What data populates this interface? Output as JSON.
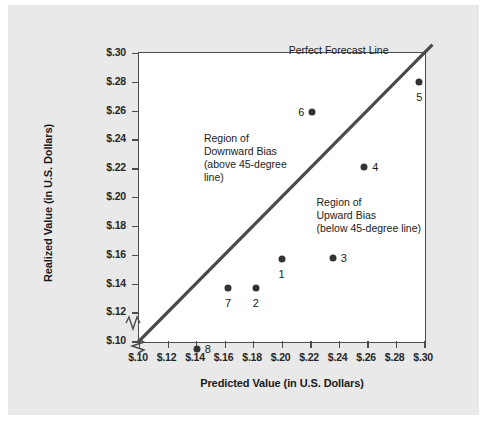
{
  "chart_data": {
    "type": "scatter",
    "title": "",
    "xlabel": "Predicted Value (in U.S. Dollars)",
    "ylabel": "Realized Value (in U.S. Dollars)",
    "xlim": [
      0.1,
      0.3
    ],
    "ylim": [
      0.1,
      0.3
    ],
    "xticks": [
      0.1,
      0.12,
      0.14,
      0.16,
      0.18,
      0.2,
      0.22,
      0.24,
      0.26,
      0.28,
      0.3
    ],
    "yticks": [
      0.1,
      0.12,
      0.14,
      0.16,
      0.18,
      0.2,
      0.22,
      0.24,
      0.26,
      0.28,
      0.3
    ],
    "xticklabels": [
      "$.10",
      "$.12",
      "$.14",
      "$.16",
      "$.18",
      "$.20",
      "$.22",
      "$.24",
      "$.26",
      "$.28",
      "$.30"
    ],
    "yticklabels": [
      "$.10",
      "$.12",
      "$.14",
      "$.16",
      "$.18",
      "$.20",
      "$.22",
      "$.24",
      "$.26",
      "$.28",
      "$.30"
    ],
    "grid": false,
    "axis_break": true,
    "legend": "none",
    "points": [
      {
        "id": "1",
        "x": 0.2,
        "y": 0.157,
        "label_dx": 0,
        "label_dy": 15
      },
      {
        "id": "2",
        "x": 0.182,
        "y": 0.137,
        "label_dx": 0,
        "label_dy": 15
      },
      {
        "id": "3",
        "x": 0.236,
        "y": 0.158,
        "label_dx": 11,
        "label_dy": 0
      },
      {
        "id": "4",
        "x": 0.258,
        "y": 0.221,
        "label_dx": 11,
        "label_dy": 0
      },
      {
        "id": "5",
        "x": 0.2965,
        "y": 0.28,
        "label_dx": 0,
        "label_dy": 15
      },
      {
        "id": "6",
        "x": 0.2215,
        "y": 0.259,
        "label_dx": -11,
        "label_dy": 0
      },
      {
        "id": "7",
        "x": 0.1625,
        "y": 0.137,
        "label_dx": 0,
        "label_dy": 15
      },
      {
        "id": "8",
        "x": 0.1405,
        "y": 0.0945,
        "label_dx": 11,
        "label_dy": 0
      }
    ],
    "reference_line": {
      "name": "perfect-forecast-line",
      "label": "Perfect Forecast Line",
      "from": [
        0.1,
        0.1
      ],
      "to": [
        0.305,
        0.305
      ],
      "color": "#4b4b4b"
    },
    "annotations": [
      {
        "name": "downward-bias-annotation",
        "text": "Region of\nDownward Bias\n(above 45-degree\nline)",
        "x": 0.1455,
        "y": 0.2455
      },
      {
        "name": "upward-bias-annotation",
        "text": "Region of\nUpward Bias\n(below 45-degree line)",
        "x": 0.2245,
        "y": 0.2005
      }
    ],
    "colors": {
      "figure_background": "#e9e9e9",
      "plot_background": "#ffffff",
      "axis": "#4b4b4b",
      "marker": "#333333",
      "text": "#1a1a1a"
    }
  }
}
